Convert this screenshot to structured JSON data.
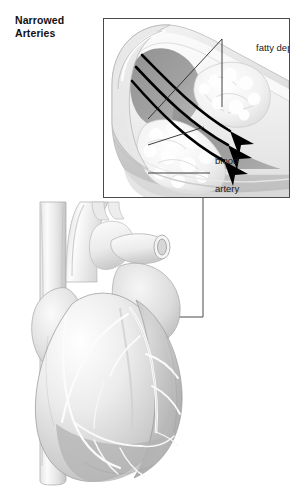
{
  "figure": {
    "title_line1": "Narrowed",
    "title_line2": "Arteries",
    "style": "grayscale-medical-pencil-illustration"
  },
  "inset": {
    "name": "artery-cross-section-inset",
    "labels": {
      "fatty_deposits": "fatty deposits",
      "blood": "blood",
      "artery": "artery"
    },
    "flow_arrows": 3,
    "arrow_direction": "left-to-right-downward"
  },
  "heart": {
    "name": "anatomical-heart-illustration",
    "detail_box": "coronary-artery-detail-box"
  },
  "colors": {
    "background": "#ffffff",
    "ink": "#1b1b1b",
    "frame": "#4a4a4a",
    "vessel_light": "#efefef",
    "vessel_mid": "#cfcfcf",
    "vessel_dark": "#9a9a9a",
    "blood_dark": "#8d8d8d",
    "plaque": "#fbfbfb",
    "arrow": "#000000"
  }
}
